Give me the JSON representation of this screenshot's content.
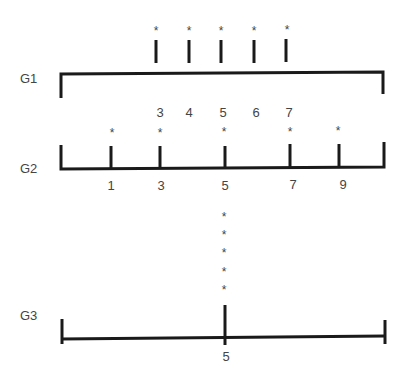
{
  "groups": [
    {
      "label": "G1",
      "orientation": "bracket-down",
      "values": [
        "3",
        "4",
        "5",
        "6",
        "7"
      ],
      "tick_x": [
        156,
        189,
        221,
        254,
        286
      ],
      "markers": [
        "*",
        "*",
        "*",
        "*",
        "*"
      ]
    },
    {
      "label": "G2",
      "orientation": "bracket-up",
      "values": [
        "1",
        "3",
        "5",
        "7",
        "9"
      ],
      "tick_x": [
        111,
        160,
        225,
        290,
        339
      ],
      "markers": [
        "*",
        "*",
        "*",
        "*",
        "*"
      ]
    },
    {
      "label": "G3",
      "orientation": "baseline",
      "values": [
        "5"
      ],
      "tick_x": [
        225
      ],
      "markers": [
        "*",
        "*",
        "*",
        "*",
        "*"
      ]
    }
  ],
  "marker_symbol": "*",
  "colors": {
    "line": "#1a1a1a",
    "text": "#444444",
    "background": "#ffffff"
  }
}
